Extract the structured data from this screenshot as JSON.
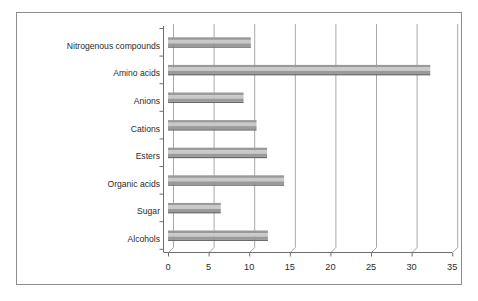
{
  "chart_data": {
    "type": "bar",
    "orientation": "horizontal",
    "title": "",
    "subtitle": "",
    "xlabel": "",
    "ylabel": "",
    "xlim": [
      0,
      35
    ],
    "xticks": [
      0,
      5,
      10,
      15,
      20,
      25,
      30,
      35
    ],
    "xtick_labels": [
      "0",
      "5",
      "10",
      "15",
      "20",
      "25",
      "30",
      "35"
    ],
    "grid": true,
    "legend": false,
    "legend_position": "none",
    "style": "3d-horizontal-bars",
    "categories": [
      "Nitrogenous compounds",
      "Amino acids",
      "Anions",
      "Cations",
      "Esters",
      "Organic acids",
      "Sugar",
      "Alcohols"
    ],
    "values": [
      10.2,
      32.3,
      9.3,
      10.9,
      12.2,
      14.3,
      6.5,
      12.3
    ],
    "series": [
      {
        "name": "Series 1",
        "values": [
          10.2,
          32.3,
          9.3,
          10.9,
          12.2,
          14.3,
          6.5,
          12.3
        ]
      }
    ]
  },
  "colors": {
    "background": "#ffffff",
    "frame_border": "#8c8c8c",
    "axis": "#6e6e6e",
    "gridline": "#a8a8a8",
    "bar_top": "#9a9a9a",
    "bar_face": "#c9c9c9",
    "bar_edge": "#6b6b6b",
    "text": "#2b2b2b"
  }
}
